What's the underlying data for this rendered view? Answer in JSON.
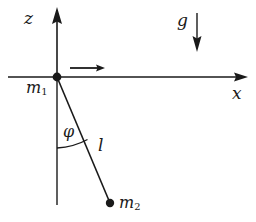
{
  "figure": {
    "background_color": "#ffffff",
    "stroke_color": "#1a1a1a",
    "width": 256,
    "height": 222
  },
  "axes": {
    "vertical": {
      "name": "z-axis",
      "label": "z",
      "direction": "up",
      "origin": {
        "x": 57,
        "y": 77
      },
      "tip": {
        "x": 57,
        "y": 8
      }
    },
    "horizontal": {
      "name": "x-axis",
      "label": "x",
      "direction": "right",
      "start": {
        "x": 8,
        "y": 77
      },
      "tip": {
        "x": 248,
        "y": 77
      }
    }
  },
  "masses": [
    {
      "name": "support-mass",
      "label": "m",
      "subscript": "1",
      "position": {
        "x": 57,
        "y": 77
      },
      "dot_radius": 4
    },
    {
      "name": "bob-mass",
      "label": "m",
      "subscript": "2",
      "position": {
        "x": 110,
        "y": 203
      },
      "dot_radius": 4
    }
  ],
  "vectors": [
    {
      "name": "gravity-arrow",
      "label": "g",
      "direction": "down",
      "start": {
        "x": 197,
        "y": 13
      },
      "end": {
        "x": 197,
        "y": 51
      }
    },
    {
      "name": "velocity-arrow",
      "label": "",
      "direction": "right",
      "start": {
        "x": 70,
        "y": 68
      },
      "end": {
        "x": 104,
        "y": 68
      }
    }
  ],
  "rod": {
    "name": "pendulum-rod",
    "label": "l",
    "from": {
      "x": 57,
      "y": 77
    },
    "to": {
      "x": 110,
      "y": 203
    }
  },
  "reference_line": {
    "name": "vertical-reference-line",
    "from": {
      "x": 57,
      "y": 77
    },
    "to": {
      "x": 57,
      "y": 205
    },
    "style": "solid"
  },
  "angle": {
    "name": "angle-phi",
    "label": "φ",
    "arc_from": {
      "x": 57,
      "y": 148
    },
    "arc_to": {
      "x": 88,
      "y": 139
    },
    "vertex": {
      "x": 57,
      "y": 77
    }
  }
}
